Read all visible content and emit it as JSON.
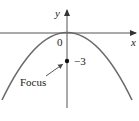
{
  "diagram": {
    "type": "parabola",
    "equation_form": "x^2 = 4py with p = -3 (opens downward)",
    "axes": {
      "x_label": "x",
      "y_label": "y",
      "origin_label": "0"
    },
    "vertex": {
      "x": 0,
      "y": 0
    },
    "focus": {
      "label": "Focus",
      "value_label": "−3",
      "x": 0,
      "y": -3
    },
    "colors": {
      "axis": "#555555",
      "curve": "#6b6b6b",
      "text": "#222222",
      "point": "#111111"
    }
  }
}
